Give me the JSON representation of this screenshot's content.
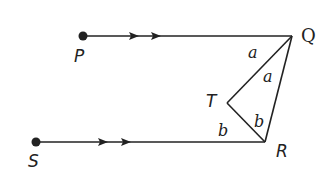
{
  "diagram": {
    "points": {
      "P": {
        "label": "P"
      },
      "Q": {
        "label": "Q"
      },
      "R": {
        "label": "R"
      },
      "S": {
        "label": "S"
      },
      "T": {
        "label": "T"
      }
    },
    "angles": {
      "a1": "a",
      "a2": "a",
      "b1": "b",
      "b2": "b"
    },
    "colors": {
      "line": "#222222",
      "background": "#ffffff"
    }
  }
}
